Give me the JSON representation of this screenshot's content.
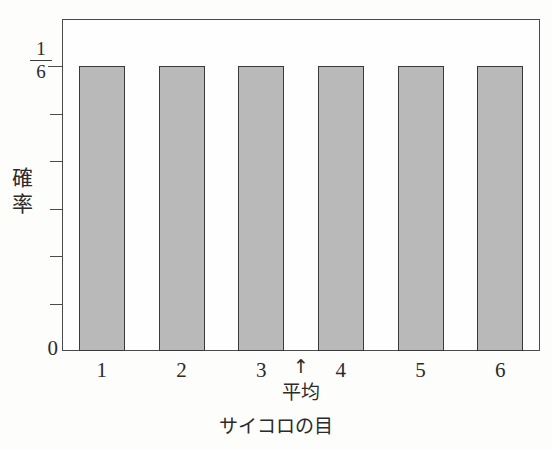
{
  "chart_data": {
    "type": "bar",
    "title": "",
    "subtitle": "",
    "categories": [
      "1",
      "2",
      "3",
      "4",
      "5",
      "6"
    ],
    "values": [
      0.1667,
      0.1667,
      0.1667,
      0.1667,
      0.1667,
      0.1667
    ],
    "value_label": "1/6",
    "xlabel": "サイコロの目",
    "ylabel": "確率",
    "ylabel_chars": [
      "確",
      "率"
    ],
    "ylim": [
      0,
      0.1944
    ],
    "y_tick_labels": [
      "0",
      "1/6"
    ],
    "y_fraction": {
      "numerator": "1",
      "denominator": "6"
    },
    "y_minor_tick_count": 6,
    "grid": false,
    "legend": null,
    "annotations": [
      {
        "name": "mean-marker",
        "glyph": "↑",
        "label": "平均",
        "x_value": 3.5,
        "between": [
          "3",
          "4"
        ]
      }
    ],
    "colors": {
      "bar_fill": "#b9b9b9",
      "bar_stroke": "#3a3a3a",
      "axis": "#4a4a4a",
      "text": "#2b2b2b",
      "background": "#fdfdfc"
    }
  },
  "axis": {
    "zero_label": "0"
  }
}
